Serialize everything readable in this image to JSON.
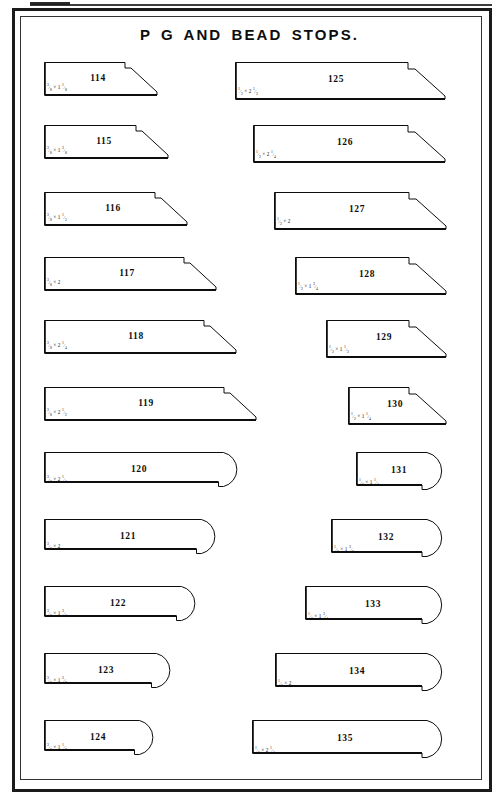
{
  "page": {
    "title": "P G AND BEAD STOPS.",
    "frame_color": "#1b1b1b",
    "ink_color": "#0d0d0d",
    "background": "#ffffff"
  },
  "profiles": [
    {
      "number": "114",
      "dimension": "3⁄8 x 1 1⁄8",
      "shape": "stepped",
      "col": 0,
      "row": 0,
      "x": 44,
      "y": 62,
      "w": 113,
      "h": 33,
      "face": 22,
      "step": 6,
      "bevel": 26
    },
    {
      "number": "115",
      "dimension": "3⁄8 x 1 3⁄8",
      "shape": "stepped",
      "col": 0,
      "row": 1,
      "x": 44,
      "y": 125,
      "w": 124,
      "h": 33,
      "face": 22,
      "step": 6,
      "bevel": 26
    },
    {
      "number": "116",
      "dimension": "3⁄8 x 1 1⁄2",
      "shape": "stepped",
      "col": 0,
      "row": 2,
      "x": 44,
      "y": 192,
      "w": 143,
      "h": 33,
      "face": 22,
      "step": 6,
      "bevel": 26
    },
    {
      "number": "117",
      "dimension": "3⁄8 x 2",
      "shape": "stepped",
      "col": 0,
      "row": 3,
      "x": 44,
      "y": 257,
      "w": 172,
      "h": 33,
      "face": 22,
      "step": 6,
      "bevel": 26
    },
    {
      "number": "118",
      "dimension": "3⁄8 x 2 1⁄4",
      "shape": "stepped",
      "col": 0,
      "row": 4,
      "x": 44,
      "y": 320,
      "w": 192,
      "h": 33,
      "face": 22,
      "step": 6,
      "bevel": 26
    },
    {
      "number": "119",
      "dimension": "3⁄8 x 2 1⁄2",
      "shape": "stepped",
      "col": 0,
      "row": 5,
      "x": 44,
      "y": 387,
      "w": 212,
      "h": 33,
      "face": 22,
      "step": 6,
      "bevel": 26
    },
    {
      "number": "120",
      "dimension": "3⁄8 x 2 1⁄4",
      "shape": "bullnose",
      "col": 0,
      "row": 6,
      "x": 44,
      "y": 452,
      "w": 197,
      "h": 35
    },
    {
      "number": "121",
      "dimension": "3⁄8 x 2",
      "shape": "bullnose",
      "col": 0,
      "row": 7,
      "x": 44,
      "y": 519,
      "w": 175,
      "h": 35
    },
    {
      "number": "122",
      "dimension": "3⁄8 x 1 3⁄4",
      "shape": "bullnose",
      "col": 0,
      "row": 8,
      "x": 44,
      "y": 586,
      "w": 155,
      "h": 35
    },
    {
      "number": "123",
      "dimension": "3⁄8 x 1 3⁄8",
      "shape": "bullnose",
      "col": 0,
      "row": 9,
      "x": 44,
      "y": 653,
      "w": 130,
      "h": 35
    },
    {
      "number": "124",
      "dimension": "3⁄8 x 1 1⁄8",
      "shape": "bullnose",
      "col": 0,
      "row": 10,
      "x": 44,
      "y": 720,
      "w": 113,
      "h": 35
    },
    {
      "number": "125",
      "dimension": "1⁄2 x 2 1⁄2",
      "shape": "stepped",
      "col": 1,
      "row": 0,
      "x": 235,
      "y": 62,
      "w": 210,
      "h": 37,
      "face": 25,
      "step": 7,
      "bevel": 30
    },
    {
      "number": "126",
      "dimension": "1⁄2 x 2 1⁄4",
      "shape": "stepped",
      "col": 1,
      "row": 1,
      "x": 253,
      "y": 125,
      "w": 192,
      "h": 37,
      "face": 25,
      "step": 7,
      "bevel": 30
    },
    {
      "number": "127",
      "dimension": "1⁄2 x 2",
      "shape": "stepped",
      "col": 1,
      "row": 2,
      "x": 274,
      "y": 192,
      "w": 172,
      "h": 37,
      "face": 25,
      "step": 7,
      "bevel": 30
    },
    {
      "number": "128",
      "dimension": "1⁄2 x 1 3⁄4",
      "shape": "stepped",
      "col": 1,
      "row": 3,
      "x": 295,
      "y": 257,
      "w": 151,
      "h": 37,
      "face": 25,
      "step": 7,
      "bevel": 30
    },
    {
      "number": "129",
      "dimension": "1⁄2 x 1 1⁄2",
      "shape": "stepped",
      "col": 1,
      "row": 4,
      "x": 326,
      "y": 320,
      "w": 120,
      "h": 37,
      "face": 25,
      "step": 7,
      "bevel": 30
    },
    {
      "number": "130",
      "dimension": "1⁄2 x 1 1⁄4",
      "shape": "stepped",
      "col": 1,
      "row": 5,
      "x": 348,
      "y": 387,
      "w": 98,
      "h": 37,
      "face": 25,
      "step": 7,
      "bevel": 30
    },
    {
      "number": "131",
      "dimension": "1⁄2 x 1 1⁄4",
      "shape": "bullnose",
      "col": 1,
      "row": 6,
      "x": 356,
      "y": 452,
      "w": 90,
      "h": 38
    },
    {
      "number": "132",
      "dimension": "1⁄2 x 1 3⁄8",
      "shape": "bullnose",
      "col": 1,
      "row": 7,
      "x": 331,
      "y": 519,
      "w": 115,
      "h": 38
    },
    {
      "number": "133",
      "dimension": "1⁄2 x 1 3⁄4",
      "shape": "bullnose",
      "col": 1,
      "row": 8,
      "x": 305,
      "y": 586,
      "w": 141,
      "h": 38
    },
    {
      "number": "134",
      "dimension": "1⁄2 x 2",
      "shape": "bullnose",
      "col": 1,
      "row": 9,
      "x": 275,
      "y": 653,
      "w": 171,
      "h": 38
    },
    {
      "number": "135",
      "dimension": "1⁄2 x 2 1⁄4",
      "shape": "bullnose",
      "col": 1,
      "row": 10,
      "x": 252,
      "y": 720,
      "w": 194,
      "h": 38
    }
  ]
}
